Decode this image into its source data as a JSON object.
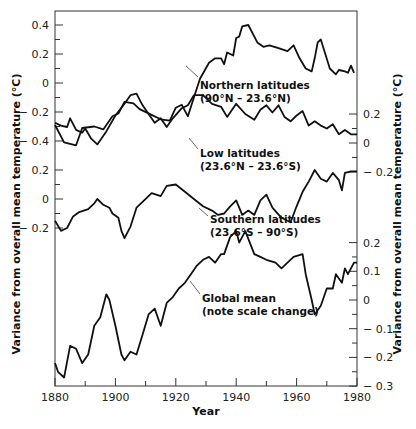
{
  "chart_data": {
    "type": "line",
    "title": "",
    "xlabel": "Year",
    "ylabel_left": "Variance from overall mean temperature (°C)",
    "ylabel_right": "Variance from overall mean temperature (°C)",
    "xlim": [
      1880,
      1980
    ],
    "x_ticks": [
      1880,
      1900,
      1920,
      1940,
      1960,
      1980
    ],
    "x_minor_ticks": [
      1890,
      1910,
      1930,
      1950,
      1970
    ],
    "grid": false,
    "legend": "inline annotations with leader lines",
    "axes": {
      "left_top": {
        "ticks": [
          "0.4",
          "0.2",
          "0",
          "-0.2",
          "-0.4"
        ],
        "series": "Northern latitudes"
      },
      "left_middle": {
        "ticks": [
          "0.2",
          "0",
          "-0.2"
        ],
        "series": "Southern latitudes"
      },
      "right_top": {
        "ticks": [
          "0.2",
          "0",
          "-0.2"
        ],
        "series": "Low latitudes"
      },
      "right_bottom": {
        "ticks": [
          "0.2",
          "0.1",
          "0",
          "-0.1",
          "-0.2",
          "-0.3"
        ],
        "series": "Global mean"
      }
    },
    "series": [
      {
        "name": "Northern latitudes (90°N – 23.6°N)",
        "axis": "left_top",
        "x": [
          1880,
          1883,
          1887,
          1889,
          1893,
          1896,
          1899,
          1901,
          1903,
          1906,
          1908,
          1912,
          1915,
          1918,
          1920,
          1922,
          1924,
          1926,
          1928,
          1931,
          1933,
          1935,
          1936,
          1937,
          1939,
          1940,
          1941,
          1942,
          1944,
          1947,
          1949,
          1951,
          1954,
          1957,
          1959,
          1961,
          1963,
          1965,
          1966,
          1967,
          1968,
          1971,
          1973,
          1974,
          1976,
          1977,
          1978,
          1979
        ],
        "values": [
          -0.29,
          -0.41,
          -0.43,
          -0.31,
          -0.3,
          -0.32,
          -0.23,
          -0.21,
          -0.13,
          -0.14,
          -0.18,
          -0.22,
          -0.25,
          -0.26,
          -0.17,
          -0.15,
          -0.23,
          -0.1,
          0.03,
          0.14,
          0.17,
          0.17,
          0.13,
          0.21,
          0.19,
          0.31,
          0.32,
          0.39,
          0.4,
          0.28,
          0.25,
          0.26,
          0.24,
          0.22,
          0.26,
          0.17,
          0.1,
          0.08,
          0.17,
          0.28,
          0.3,
          0.1,
          0.06,
          0.09,
          0.08,
          0.07,
          0.12,
          0.07
        ]
      },
      {
        "name": "Low latitudes (23.6°N – 23.6°S)",
        "axis": "right_top",
        "x": [
          1880,
          1882,
          1884,
          1885,
          1887,
          1889,
          1890,
          1892,
          1894,
          1897,
          1900,
          1903,
          1905,
          1907,
          1909,
          1911,
          1913,
          1915,
          1917,
          1919,
          1922,
          1924,
          1926,
          1929,
          1932,
          1935,
          1937,
          1940,
          1943,
          1946,
          1948,
          1950,
          1952,
          1954,
          1956,
          1958,
          1960,
          1962,
          1964,
          1966,
          1968,
          1970,
          1972,
          1974,
          1976,
          1978,
          1980
        ],
        "values": [
          0.14,
          0.12,
          0.11,
          0.17,
          0.09,
          0.07,
          0.1,
          0.03,
          -0.01,
          0.08,
          0.19,
          0.27,
          0.33,
          0.34,
          0.26,
          0.2,
          0.14,
          0.17,
          0.11,
          0.17,
          0.24,
          0.26,
          0.33,
          0.33,
          0.27,
          0.25,
          0.18,
          0.27,
          0.2,
          0.16,
          0.23,
          0.26,
          0.21,
          0.26,
          0.18,
          0.15,
          0.19,
          0.22,
          0.12,
          0.15,
          0.12,
          0.1,
          0.13,
          0.06,
          0.09,
          0.06,
          0.06
        ]
      },
      {
        "name": "Southern latitudes (23.6°S – 90°S)",
        "axis": "left_middle",
        "x": [
          1880,
          1882,
          1884,
          1886,
          1888,
          1891,
          1893,
          1894,
          1896,
          1898,
          1899,
          1901,
          1902,
          1903,
          1905,
          1907,
          1909,
          1912,
          1915,
          1917,
          1920,
          1923,
          1926,
          1929,
          1932,
          1934,
          1936,
          1938,
          1940,
          1942,
          1944,
          1946,
          1948,
          1950,
          1952,
          1955,
          1958,
          1960,
          1962,
          1964,
          1966,
          1968,
          1970,
          1972,
          1974,
          1975,
          1976,
          1978,
          1980
        ],
        "values": [
          -0.15,
          -0.22,
          -0.2,
          -0.12,
          -0.09,
          -0.07,
          -0.03,
          0.0,
          -0.04,
          -0.06,
          -0.1,
          -0.13,
          -0.22,
          -0.27,
          -0.19,
          -0.06,
          -0.02,
          0.04,
          0.02,
          0.09,
          0.1,
          0.05,
          0.0,
          -0.05,
          -0.08,
          -0.11,
          -0.1,
          -0.05,
          -0.01,
          -0.11,
          -0.08,
          -0.11,
          -0.01,
          0.03,
          -0.06,
          -0.13,
          -0.16,
          -0.05,
          0.05,
          0.12,
          0.2,
          0.14,
          0.12,
          0.18,
          0.13,
          0.06,
          0.18,
          0.19,
          0.19
        ]
      },
      {
        "name": "Global mean (note scale change)",
        "axis": "right_bottom",
        "x": [
          1880,
          1881,
          1883,
          1885,
          1887,
          1889,
          1891,
          1893,
          1895,
          1897,
          1898,
          1900,
          1902,
          1903,
          1905,
          1907,
          1909,
          1911,
          1913,
          1915,
          1917,
          1919,
          1921,
          1923,
          1925,
          1927,
          1929,
          1931,
          1933,
          1935,
          1936,
          1938,
          1940,
          1941,
          1943,
          1946,
          1948,
          1950,
          1953,
          1955,
          1957,
          1959,
          1962,
          1963,
          1965,
          1966,
          1968,
          1970,
          1972,
          1973,
          1975,
          1976,
          1977,
          1979,
          1980
        ],
        "values": [
          -0.22,
          -0.25,
          -0.27,
          -0.16,
          -0.17,
          -0.22,
          -0.19,
          -0.09,
          -0.06,
          0.02,
          0.0,
          -0.09,
          -0.19,
          -0.21,
          -0.18,
          -0.19,
          -0.12,
          -0.05,
          -0.03,
          -0.09,
          -0.01,
          0.01,
          0.04,
          0.06,
          0.09,
          0.12,
          0.14,
          0.15,
          0.13,
          0.16,
          0.16,
          0.22,
          0.24,
          0.2,
          0.24,
          0.16,
          0.15,
          0.14,
          0.13,
          0.11,
          0.13,
          0.15,
          0.16,
          0.09,
          0.0,
          -0.05,
          -0.02,
          0.04,
          0.04,
          0.09,
          0.06,
          0.11,
          0.09,
          0.13,
          0.13
        ]
      }
    ],
    "annotations": [
      {
        "line1": "Northern latitudes",
        "line2": "(90°N – 23.6°N)"
      },
      {
        "line1": "Low latitudes",
        "line2": "(23.6°N – 23.6°S)"
      },
      {
        "line1": "Southern latitudes",
        "line2": "(23.6°S – 90°S)"
      },
      {
        "line1": "Global mean",
        "line2": "(note scale change)"
      }
    ]
  }
}
